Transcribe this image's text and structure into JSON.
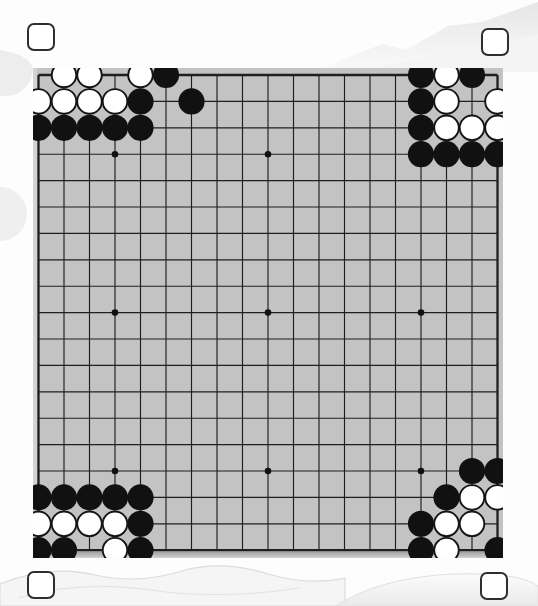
{
  "board": {
    "size": 19,
    "star_points": [
      [
        4,
        4
      ],
      [
        10,
        4
      ],
      [
        16,
        4
      ],
      [
        4,
        10
      ],
      [
        10,
        10
      ],
      [
        16,
        10
      ],
      [
        4,
        16
      ],
      [
        10,
        16
      ],
      [
        16,
        16
      ]
    ],
    "stones": {
      "black": [
        [
          6,
          1
        ],
        [
          5,
          2
        ],
        [
          7,
          2
        ],
        [
          1,
          3
        ],
        [
          2,
          3
        ],
        [
          3,
          3
        ],
        [
          4,
          3
        ],
        [
          5,
          3
        ],
        [
          16,
          1
        ],
        [
          18,
          1
        ],
        [
          16,
          2
        ],
        [
          16,
          3
        ],
        [
          16,
          4
        ],
        [
          17,
          4
        ],
        [
          18,
          4
        ],
        [
          19,
          4
        ],
        [
          1,
          17
        ],
        [
          2,
          17
        ],
        [
          3,
          17
        ],
        [
          4,
          17
        ],
        [
          5,
          17
        ],
        [
          5,
          18
        ],
        [
          1,
          19
        ],
        [
          2,
          19
        ],
        [
          5,
          19
        ],
        [
          18,
          16
        ],
        [
          19,
          16
        ],
        [
          17,
          17
        ],
        [
          16,
          18
        ],
        [
          16,
          19
        ],
        [
          19,
          19
        ]
      ],
      "white": [
        [
          2,
          1
        ],
        [
          3,
          1
        ],
        [
          5,
          1
        ],
        [
          1,
          2
        ],
        [
          2,
          2
        ],
        [
          3,
          2
        ],
        [
          4,
          2
        ],
        [
          17,
          1
        ],
        [
          17,
          2
        ],
        [
          19,
          2
        ],
        [
          17,
          3
        ],
        [
          18,
          3
        ],
        [
          19,
          3
        ],
        [
          1,
          18
        ],
        [
          2,
          18
        ],
        [
          3,
          18
        ],
        [
          4,
          18
        ],
        [
          4,
          19
        ],
        [
          18,
          17
        ],
        [
          19,
          17
        ],
        [
          17,
          18
        ],
        [
          18,
          18
        ],
        [
          17,
          19
        ]
      ]
    },
    "black_stone_count": 31,
    "white_stone_count": 23
  },
  "corner_markers": {
    "count": 4,
    "positions": [
      "top-left",
      "top-right",
      "bottom-left",
      "bottom-right"
    ]
  },
  "colors": {
    "background": "#fdfdfd",
    "board": "#c3c3c3",
    "grid_line": "#1f1f1f",
    "black_stone": "#111111",
    "white_stone": "#ffffff",
    "stone_outline": "#141414",
    "star_point": "#111111",
    "marker_border": "#2e2e2e",
    "marker_fill": "#ffffff",
    "watermark": "#e9e9e9",
    "watermark_line": "#d8d8d8"
  }
}
